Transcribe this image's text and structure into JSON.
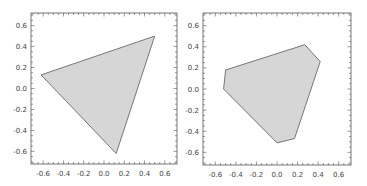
{
  "chart_data": [
    {
      "type": "area",
      "title": "",
      "xlabel": "",
      "ylabel": "",
      "xlim": [
        -0.72,
        0.72
      ],
      "ylim": [
        -0.72,
        0.72
      ],
      "grid": false,
      "x_ticks": [
        "-0.6",
        "-0.4",
        "-0.2",
        "0.0",
        "0.2",
        "0.4",
        "0.6"
      ],
      "y_ticks": [
        "0.6",
        "0.4",
        "0.2",
        "0.0",
        "-0.2",
        "-0.4",
        "-0.6"
      ],
      "fill_color": "#d6d6d6",
      "edge_color": "#777777",
      "polygon": [
        [
          -0.62,
          0.13
        ],
        [
          0.5,
          0.5
        ],
        [
          0.12,
          -0.62
        ]
      ]
    },
    {
      "type": "area",
      "title": "",
      "xlabel": "",
      "ylabel": "",
      "xlim": [
        -0.72,
        0.72
      ],
      "ylim": [
        -0.72,
        0.72
      ],
      "grid": false,
      "x_ticks": [
        "-0.6",
        "-0.4",
        "-0.2",
        "0.0",
        "0.2",
        "0.4",
        "0.6"
      ],
      "y_ticks": [
        "0.6",
        "0.4",
        "0.2",
        "0.0",
        "-0.2",
        "-0.4",
        "-0.6"
      ],
      "fill_color": "#d6d6d6",
      "edge_color": "#777777",
      "polygon": [
        [
          -0.5,
          0.18
        ],
        [
          0.27,
          0.42
        ],
        [
          0.42,
          0.26
        ],
        [
          0.17,
          -0.47
        ],
        [
          0.0,
          -0.51
        ],
        [
          -0.52,
          0.0
        ]
      ]
    }
  ]
}
